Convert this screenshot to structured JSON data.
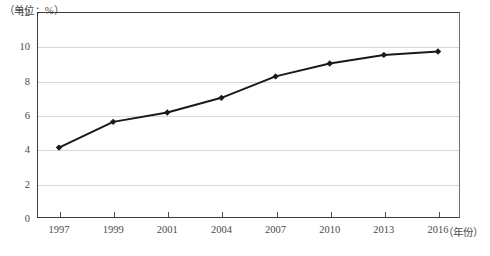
{
  "chart_data": {
    "type": "line",
    "title": "",
    "unit_note": "（单位：%）",
    "xlabel": "（年份）",
    "ylabel": "",
    "categories": [
      "1997",
      "1999",
      "2001",
      "2004",
      "2007",
      "2010",
      "2013",
      "2016"
    ],
    "values": [
      4.1,
      5.6,
      6.15,
      7.0,
      8.25,
      9.0,
      9.5,
      9.7
    ],
    "series": [
      {
        "name": "",
        "values": [
          4.1,
          5.6,
          6.15,
          7.0,
          8.25,
          9.0,
          9.5,
          9.7
        ]
      }
    ],
    "ylim": [
      0,
      12
    ],
    "yticks": [
      "0",
      "2",
      "4",
      "6",
      "8",
      "10",
      "12"
    ],
    "ytick_values": [
      0,
      2,
      4,
      6,
      8,
      10,
      12
    ],
    "grid": true,
    "legend": "none",
    "marker": "diamond",
    "line_color": "#1a1a1a",
    "grid_color": "#d6d6d6",
    "axis_color": "#3c3c3c"
  },
  "axis": {
    "unit_note": "（单位：%）",
    "x_axis_title": "（年份）"
  }
}
